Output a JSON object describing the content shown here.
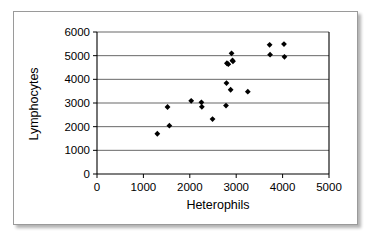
{
  "figure": {
    "top_clipped_text": ". .   . . .",
    "frame_border_color": "#9a9a9a",
    "background_color": "#ffffff",
    "marker_color": "#000000",
    "grid_color": "#4d4d4d"
  },
  "chart_data": {
    "type": "scatter",
    "title": "",
    "xlabel": "Heterophils",
    "ylabel": "Lymphocytes",
    "xlim": [
      0,
      5000
    ],
    "ylim": [
      0,
      6000
    ],
    "xticks": [
      0,
      1000,
      2000,
      3000,
      4000,
      5000
    ],
    "yticks": [
      0,
      1000,
      2000,
      3000,
      4000,
      5000,
      6000
    ],
    "xticklabels": [
      "0",
      "1000",
      "2000",
      "3000",
      "4000",
      "5000"
    ],
    "yticklabels": [
      "0",
      "1000",
      "2000",
      "3000",
      "4000",
      "5000",
      "6000"
    ],
    "grid": "horizontal",
    "legend": "none",
    "marker": "diamond",
    "series": [
      {
        "name": "Heterophils vs Lymphocytes",
        "points": [
          [
            1300,
            1700
          ],
          [
            1520,
            2830
          ],
          [
            1560,
            2040
          ],
          [
            2030,
            3090
          ],
          [
            2250,
            3030
          ],
          [
            2260,
            2840
          ],
          [
            2490,
            2320
          ],
          [
            2780,
            2890
          ],
          [
            2790,
            3840
          ],
          [
            2800,
            4680
          ],
          [
            2830,
            4640
          ],
          [
            2880,
            3560
          ],
          [
            2900,
            5100
          ],
          [
            2920,
            4800
          ],
          [
            2930,
            4760
          ],
          [
            3250,
            3480
          ],
          [
            3720,
            5460
          ],
          [
            3730,
            5040
          ],
          [
            4030,
            5490
          ],
          [
            4040,
            4950
          ]
        ]
      }
    ]
  }
}
